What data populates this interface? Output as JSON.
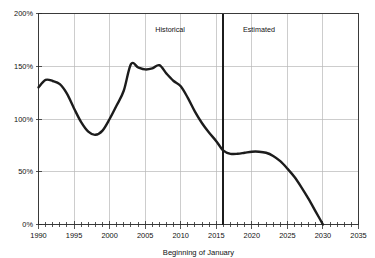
{
  "chart_data": {
    "type": "line",
    "title": "",
    "xlabel": "Beginning of January",
    "ylabel": "",
    "xlim": [
      1990,
      2035
    ],
    "ylim": [
      0,
      200
    ],
    "grid": true,
    "legend_position": "none",
    "x_tick_labels": [
      "1990",
      "1995",
      "2000",
      "2005",
      "2010",
      "2015",
      "2020",
      "2025",
      "2030",
      "2035"
    ],
    "x_ticks": [
      1990,
      1995,
      2000,
      2005,
      2010,
      2015,
      2020,
      2025,
      2030,
      2035
    ],
    "x_minor_tick_interval": 1,
    "y_tick_labels": [
      "0%",
      "50%",
      "100%",
      "150%",
      "200%"
    ],
    "y_ticks": [
      0,
      50,
      100,
      150,
      200
    ],
    "annotations": [
      {
        "text": "Historical",
        "x": 2008.5,
        "y": 182
      },
      {
        "text": "Estimated",
        "x": 2021.0,
        "y": 182
      }
    ],
    "divider": {
      "x": 2016,
      "label": "historical-estimated-boundary"
    },
    "series": [
      {
        "name": "Funded ratio",
        "x": [
          1990,
          1991,
          1992,
          1993,
          1994,
          1995,
          1996,
          1997,
          1998,
          1999,
          2000,
          2001,
          2002,
          2003,
          2004,
          2005,
          2006,
          2007,
          2008,
          2009,
          2010,
          2011,
          2012,
          2013,
          2014,
          2015,
          2016,
          2017,
          2018,
          2019,
          2020,
          2021,
          2022,
          2023,
          2024,
          2025,
          2026,
          2027,
          2028,
          2029,
          2030
        ],
        "values": [
          130,
          137,
          136,
          133,
          124,
          110,
          97,
          88,
          85,
          89,
          100,
          113,
          127,
          152,
          149,
          147,
          148,
          151,
          143,
          136,
          131,
          120,
          107,
          96,
          87,
          79,
          70,
          67,
          67,
          68,
          69,
          69,
          68,
          65,
          60,
          53,
          45,
          35,
          24,
          12,
          0
        ]
      }
    ]
  },
  "colors": {
    "curve": "#1c1c1c",
    "grid": "#b8b8b8",
    "frame": "#3a3a3a",
    "divider": "#1c1c1c",
    "background": "#ffffff"
  }
}
